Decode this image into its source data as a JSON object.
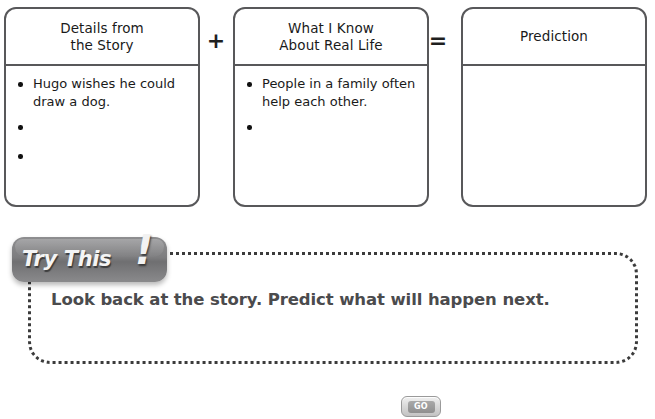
{
  "page": {
    "background_color": "#ffffff",
    "box_border_color": "#58585a",
    "badge_color": "#7d7d7f",
    "prompt_text_color": "#4b4b4d",
    "dotted_border_color": "#3b3b3b"
  },
  "chart": {
    "boxes": [
      {
        "header": "Details from\nthe Story",
        "items": [
          "Hugo wishes he could draw a dog.",
          "",
          ""
        ]
      },
      {
        "header": "What I Know\nAbout Real Life",
        "items": [
          "People in a family often help each other.",
          ""
        ]
      },
      {
        "header": "Prediction",
        "items": []
      }
    ],
    "operators": [
      {
        "name": "plus",
        "symbol": "+"
      },
      {
        "name": "equals",
        "symbol": "="
      }
    ]
  },
  "try_this": {
    "badge_label": "Try This",
    "badge_bang": "!",
    "prompt": "Look back at the story. Predict what will happen next."
  },
  "footer": {
    "go_label": "GO"
  }
}
